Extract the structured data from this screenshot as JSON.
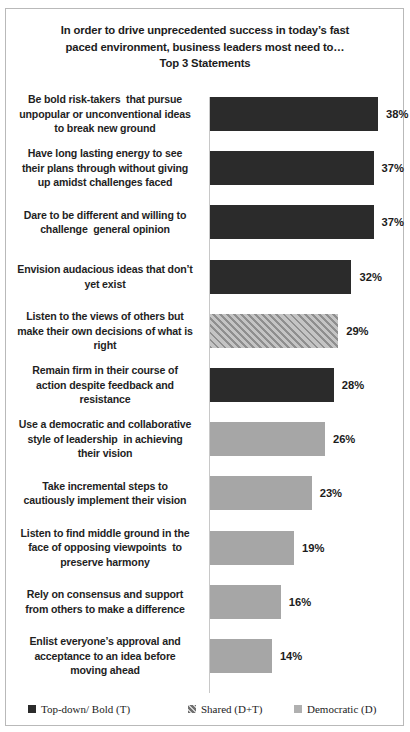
{
  "chart_data": {
    "type": "bar",
    "orientation": "horizontal",
    "title": "In order to drive unprecedented success in today’s fast paced environment, business leaders most need to…\nTop 3 Statements",
    "title_lines": [
      "In order to drive unprecedented success in today’s fast",
      "paced environment, business leaders most need to…",
      "Top 3 Statements"
    ],
    "xlabel": "",
    "ylabel": "",
    "grid": false,
    "axis_visible": true,
    "value_suffix": "%",
    "xlim": [
      0,
      40
    ],
    "categories": [
      "Be bold risk-takers  that pursue unpopular or unconventional ideas to break new ground",
      "Have long lasting energy to see their plans through without giving up amidst challenges faced",
      "Dare to be different and willing to challenge  general opinion",
      "Envision audacious ideas that don’t yet exist",
      "Listen to the views of others but make their own decisions of what is right",
      "Remain firm in their course of action despite feedback and resistance",
      "Use a democratic and collaborative style of leadership  in achieving their vision",
      "Take incremental steps to cautiously implement their vision",
      "Listen to find middle ground in the face of opposing viewpoints  to preserve harmony",
      "Rely on consensus and support from others to make a difference",
      "Enlist everyone’s approval and acceptance to an idea before moving ahead"
    ],
    "values": [
      38,
      37,
      37,
      32,
      29,
      28,
      26,
      23,
      19,
      16,
      14
    ],
    "value_labels": [
      "38%",
      "37%",
      "37%",
      "32%",
      "29%",
      "28%",
      "26%",
      "23%",
      "19%",
      "16%",
      "14%"
    ],
    "series_of_bar": [
      "topdown",
      "topdown",
      "topdown",
      "topdown",
      "shared",
      "topdown",
      "democratic",
      "democratic",
      "democratic",
      "democratic",
      "democratic"
    ],
    "legend_position": "bottom",
    "legend": [
      {
        "key": "topdown",
        "label": "Top-down/ Bold (T)",
        "color": "#2b2b2b"
      },
      {
        "key": "shared",
        "label": "Shared (D+T)",
        "color": "#a9a9a9"
      },
      {
        "key": "democratic",
        "label": "Democratic (D)",
        "color": "#a6a6a6"
      }
    ]
  },
  "bars": [
    {
      "label_lines": [
        "Be bold risk-takers  that pursue",
        "unpopular or unconventional ideas",
        "to break new ground"
      ],
      "value_label": "38%",
      "value": 38,
      "series": "topdown"
    },
    {
      "label_lines": [
        "Have long lasting energy to see",
        "their plans through without giving",
        "up amidst challenges faced"
      ],
      "value_label": "37%",
      "value": 37,
      "series": "topdown"
    },
    {
      "label_lines": [
        "Dare to be different and willing to",
        "challenge  general opinion"
      ],
      "value_label": "37%",
      "value": 37,
      "series": "topdown"
    },
    {
      "label_lines": [
        "Envision audacious ideas that don’t",
        "yet exist"
      ],
      "value_label": "32%",
      "value": 32,
      "series": "topdown"
    },
    {
      "label_lines": [
        "Listen to the views of others but",
        "make their own decisions of what is",
        "right"
      ],
      "value_label": "29%",
      "value": 29,
      "series": "shared"
    },
    {
      "label_lines": [
        "Remain firm in their course of",
        "action despite feedback and",
        "resistance"
      ],
      "value_label": "28%",
      "value": 28,
      "series": "topdown"
    },
    {
      "label_lines": [
        "Use a democratic and collaborative",
        "style of leadership  in achieving",
        "their vision"
      ],
      "value_label": "26%",
      "value": 26,
      "series": "democratic"
    },
    {
      "label_lines": [
        "Take incremental steps to",
        "cautiously implement their vision"
      ],
      "value_label": "23%",
      "value": 23,
      "series": "democratic"
    },
    {
      "label_lines": [
        "Listen to find middle ground in the",
        "face of opposing viewpoints  to",
        "preserve harmony"
      ],
      "value_label": "19%",
      "value": 19,
      "series": "democratic"
    },
    {
      "label_lines": [
        "Rely on consensus and support",
        "from others to make a difference"
      ],
      "value_label": "16%",
      "value": 16,
      "series": "democratic"
    },
    {
      "label_lines": [
        "Enlist everyone’s approval and",
        "acceptance to an idea before",
        "moving ahead"
      ],
      "value_label": "14%",
      "value": 14,
      "series": "democratic"
    }
  ],
  "legend": {
    "items": [
      {
        "label": "Top-down/ Bold (T)",
        "series": "topdown"
      },
      {
        "label": "Shared (D+T)",
        "series": "shared"
      },
      {
        "label": "Democratic (D)",
        "series": "democratic"
      }
    ]
  }
}
